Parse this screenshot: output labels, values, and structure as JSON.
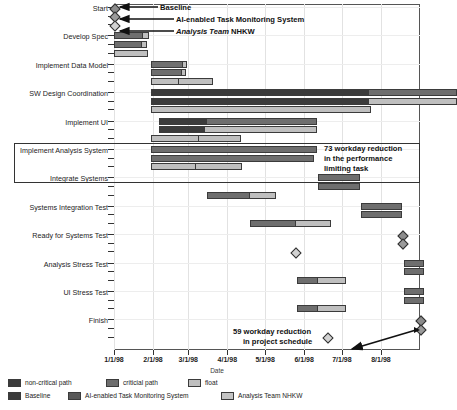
{
  "chart_data": {
    "type": "bar",
    "chart_kind": "gantt",
    "title": "",
    "xlabel": "Date",
    "ylabel": "",
    "grid": true,
    "x_axis": {
      "tick_labels": [
        "1/1/98",
        "2/1/98",
        "3/1/98",
        "4/1/98",
        "5/1/98",
        "6/1/98",
        "7/1/98",
        "8/1/98"
      ],
      "tick_days": [
        0,
        31,
        59,
        90,
        120,
        151,
        181,
        212
      ],
      "range_days": [
        0,
        243
      ]
    },
    "scenarios": [
      {
        "key": "baseline",
        "name": "Baseline"
      },
      {
        "key": "ai",
        "name": "AI-enabled Task Monitoring System"
      },
      {
        "key": "analysis",
        "name": "Analysis Team NHKW"
      }
    ],
    "segment_types": [
      {
        "key": "noncritical",
        "label": "non-critical path",
        "color": "#3b3b3b"
      },
      {
        "key": "critical",
        "label": "criticial path",
        "color": "#6e6e6e"
      },
      {
        "key": "float",
        "label": "float",
        "color": "#bfbfbf"
      }
    ],
    "categories": [
      "Start",
      "Develop Spec",
      "Implement Data Model",
      "SW Design Coordination",
      "Implement UI",
      "Implement Analysis System",
      "Integrate Systems",
      "Systems Integration Test",
      "Ready for Systems Test",
      "Analysis Stress Test",
      "UI Stress Test",
      "Finish"
    ],
    "tasks": [
      {
        "name": "Start",
        "milestone": true,
        "bars": [
          {
            "scenario": "baseline",
            "start_day": 0,
            "segments": []
          },
          {
            "scenario": "ai",
            "start_day": 0,
            "segments": []
          },
          {
            "scenario": "analysis",
            "start_day": 0,
            "segments": []
          }
        ]
      },
      {
        "name": "Develop Spec",
        "bars": [
          {
            "scenario": "baseline",
            "start_day": 0,
            "segments": [
              {
                "type": "critical",
                "days": 23
              },
              {
                "type": "float",
                "days": 5
              }
            ]
          },
          {
            "scenario": "ai",
            "start_day": 0,
            "segments": [
              {
                "type": "critical",
                "days": 22
              },
              {
                "type": "float",
                "days": 4
              }
            ]
          },
          {
            "scenario": "analysis",
            "start_day": 0,
            "segments": [
              {
                "type": "float",
                "days": 27
              }
            ]
          }
        ]
      },
      {
        "name": "Implement Data Model",
        "bars": [
          {
            "scenario": "baseline",
            "start_day": 29,
            "segments": [
              {
                "type": "critical",
                "days": 26
              },
              {
                "type": "float",
                "days": 3
              }
            ]
          },
          {
            "scenario": "ai",
            "start_day": 29,
            "segments": [
              {
                "type": "critical",
                "days": 25
              },
              {
                "type": "float",
                "days": 3
              }
            ]
          },
          {
            "scenario": "analysis",
            "start_day": 29,
            "segments": [
              {
                "type": "float",
                "days": 22
              },
              {
                "type": "float",
                "days": 28
              }
            ]
          }
        ]
      },
      {
        "name": "SW Design Coordination",
        "bars": [
          {
            "scenario": "baseline",
            "start_day": 29,
            "segments": [
              {
                "type": "noncritical",
                "days": 173
              },
              {
                "type": "critical",
                "days": 70
              }
            ]
          },
          {
            "scenario": "ai",
            "start_day": 29,
            "segments": [
              {
                "type": "noncritical",
                "days": 173
              },
              {
                "type": "float",
                "days": 70
              }
            ]
          },
          {
            "scenario": "analysis",
            "start_day": 29,
            "segments": [
              {
                "type": "float",
                "days": 175
              }
            ]
          }
        ]
      },
      {
        "name": "Implement UI",
        "bars": [
          {
            "scenario": "baseline",
            "start_day": 36,
            "segments": [
              {
                "type": "noncritical",
                "days": 37
              },
              {
                "type": "critical",
                "days": 88
              }
            ]
          },
          {
            "scenario": "ai",
            "start_day": 36,
            "segments": [
              {
                "type": "noncritical",
                "days": 35
              },
              {
                "type": "float",
                "days": 90
              }
            ]
          },
          {
            "scenario": "analysis",
            "start_day": 29,
            "segments": [
              {
                "type": "float",
                "days": 38
              },
              {
                "type": "float",
                "days": 34
              }
            ]
          }
        ]
      },
      {
        "name": "Implement Analysis System",
        "bars": [
          {
            "scenario": "baseline",
            "start_day": 29,
            "segments": [
              {
                "type": "critical",
                "days": 132
              }
            ]
          },
          {
            "scenario": "ai",
            "start_day": 29,
            "segments": [
              {
                "type": "critical",
                "days": 130
              }
            ]
          },
          {
            "scenario": "analysis",
            "start_day": 29,
            "segments": [
              {
                "type": "float",
                "days": 35
              },
              {
                "type": "float",
                "days": 38
              }
            ]
          }
        ]
      },
      {
        "name": "Integrate Systems",
        "bars": [
          {
            "scenario": "baseline",
            "start_day": 162,
            "segments": [
              {
                "type": "critical",
                "days": 33
              }
            ]
          },
          {
            "scenario": "ai",
            "start_day": 162,
            "segments": [
              {
                "type": "critical",
                "days": 33
              }
            ]
          },
          {
            "scenario": "analysis",
            "start_day": 74,
            "segments": [
              {
                "type": "critical",
                "days": 33
              },
              {
                "type": "float",
                "days": 22
              }
            ]
          }
        ]
      },
      {
        "name": "Systems Integration Test",
        "bars": [
          {
            "scenario": "baseline",
            "start_day": 196,
            "segments": [
              {
                "type": "critical",
                "days": 33
              }
            ]
          },
          {
            "scenario": "ai",
            "start_day": 196,
            "segments": [
              {
                "type": "critical",
                "days": 33
              }
            ]
          },
          {
            "scenario": "analysis",
            "start_day": 108,
            "segments": [
              {
                "type": "critical",
                "days": 36
              },
              {
                "type": "float",
                "days": 28
              }
            ]
          }
        ]
      },
      {
        "name": "Ready for Systems Test",
        "milestone": true,
        "bars": [
          {
            "scenario": "baseline",
            "start_day": 229,
            "segments": []
          },
          {
            "scenario": "ai",
            "start_day": 229,
            "segments": []
          },
          {
            "scenario": "analysis",
            "start_day": 144,
            "segments": []
          }
        ]
      },
      {
        "name": "Analysis Stress Test",
        "bars": [
          {
            "scenario": "baseline",
            "start_day": 230,
            "segments": [
              {
                "type": "critical",
                "days": 16
              }
            ]
          },
          {
            "scenario": "ai",
            "start_day": 230,
            "segments": [
              {
                "type": "critical",
                "days": 16
              }
            ]
          },
          {
            "scenario": "analysis",
            "start_day": 145,
            "segments": [
              {
                "type": "critical",
                "days": 16
              },
              {
                "type": "float",
                "days": 23
              }
            ]
          }
        ]
      },
      {
        "name": "UI Stress Test",
        "bars": [
          {
            "scenario": "baseline",
            "start_day": 230,
            "segments": [
              {
                "type": "critical",
                "days": 16
              }
            ]
          },
          {
            "scenario": "ai",
            "start_day": 230,
            "segments": [
              {
                "type": "critical",
                "days": 16
              }
            ]
          },
          {
            "scenario": "analysis",
            "start_day": 145,
            "segments": [
              {
                "type": "critical",
                "days": 16
              },
              {
                "type": "float",
                "days": 23
              }
            ]
          }
        ]
      },
      {
        "name": "Finish",
        "milestone": true,
        "bars": [
          {
            "scenario": "baseline",
            "start_day": 243,
            "segments": []
          },
          {
            "scenario": "ai",
            "start_day": 243,
            "segments": []
          },
          {
            "scenario": "analysis",
            "start_day": 169,
            "segments": []
          }
        ]
      }
    ],
    "annotations": [
      {
        "id": "ann-73",
        "text_lines": [
          "73 workday reduction",
          "in the performance",
          "limiting task"
        ],
        "has_box": true
      },
      {
        "id": "ann-59",
        "text_lines": [
          "59 workday reduction",
          "in project schedule"
        ],
        "has_arrow": true
      }
    ],
    "callouts": [
      {
        "id": "callout-baseline",
        "text": "Baseline",
        "style": "bold"
      },
      {
        "id": "callout-ai",
        "text": "AI-enabled Task Monitoring System",
        "style": "bold"
      },
      {
        "id": "callout-analysis",
        "text_italic": "Analysis Team",
        "text_regular": " NHKW",
        "style": "bold-italic"
      }
    ]
  },
  "axis": {
    "x_title": "Date",
    "x_ticks": [
      "1/1/98",
      "2/1/98",
      "3/1/98",
      "4/1/98",
      "5/1/98",
      "6/1/98",
      "7/1/98",
      "8/1/98"
    ],
    "y_labels": [
      "Start",
      "Develop Spec",
      "Implement Data Model",
      "SW Design Coordination",
      "Implement UI",
      "Implement Analysis System",
      "Integrate Systems",
      "Systems Integration Test",
      "Ready for Systems Test",
      "Analysis Stress Test",
      "UI Stress Test",
      "Finish"
    ]
  },
  "legend": {
    "row1": [
      {
        "label": "non-critical path",
        "color": "#3b3b3b"
      },
      {
        "label": "criticial path",
        "color": "#6e6e6e"
      },
      {
        "label": "float",
        "color": "#bfbfbf"
      }
    ],
    "row2": [
      {
        "label": "Baseline",
        "color": "#3b3b3b"
      },
      {
        "label": "AI-enabled Task Monitoring System",
        "color": "#585858"
      },
      {
        "label": "Analysis Team NHKW",
        "color": "#c4c4c4"
      }
    ]
  },
  "annotation_73": {
    "line1": "73 workday reduction",
    "line2": "in the performance",
    "line3": "limiting task"
  },
  "annotation_59": {
    "line1": "59 workday reduction",
    "line2": "in project schedule"
  },
  "callouts": {
    "baseline": "Baseline",
    "ai": "AI-enabled Task Monitoring System",
    "analysis_italic": "Analysis Team",
    "analysis_regular": " NHKW"
  },
  "colors": {
    "noncritical": "#3b3b3b",
    "critical": "#6e6e6e",
    "float": "#bfbfbf",
    "axis": "#333333",
    "grid": "#e4e4e4"
  }
}
